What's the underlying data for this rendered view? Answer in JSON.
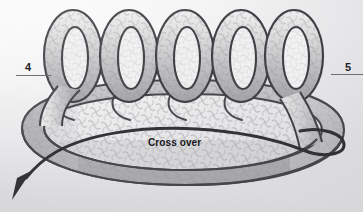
{
  "figure": {
    "kind": "instructional-diagram",
    "annotations": {
      "crossover": "Cross over"
    },
    "page_markers": {
      "left": "4",
      "right": "5"
    },
    "arrow": {
      "name": "direction-arrow",
      "points": "down-left"
    },
    "palette": {
      "background": "#ededee",
      "band_outline": "#3b3b40",
      "band_fill_light": "#e3e3e4",
      "band_fill_mid": "#b9b9bb",
      "band_fill_dark": "#9a9a9d",
      "mesh_line": "#8f8f93",
      "thin_loop": "#3b3b40",
      "label_text": "#1d1d1f",
      "rule": "#6e6e73"
    },
    "coil": {
      "loop_count": 5
    }
  }
}
